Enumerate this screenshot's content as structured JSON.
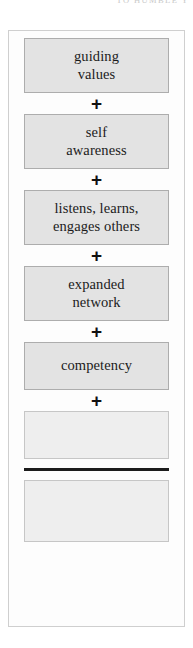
{
  "page": {
    "running_head": "TO HUMBLE Y"
  },
  "figure": {
    "name": "leadership-equation-diagram",
    "operator_symbol": "+",
    "colors": {
      "term_fill": "#e3e3e3",
      "term_border": "#adadad",
      "blank_fill": "#eeeeee",
      "blank_border": "#c6c6c6",
      "frame_border": "#cfcfcf",
      "rule": "#1c1c1c",
      "text": "#1b1b1b"
    },
    "terms": [
      {
        "label": "guiding\nvalues",
        "line1": "guiding",
        "line2": "values",
        "blank": false
      },
      {
        "label": "self\nawareness",
        "line1": "self",
        "line2": "awareness",
        "blank": false
      },
      {
        "label": "listens, learns,\nengages others",
        "line1": "listens, learns,",
        "line2": "engages others",
        "blank": false
      },
      {
        "label": "expanded\nnetwork",
        "line1": "expanded",
        "line2": "network",
        "blank": false
      },
      {
        "label": "competency",
        "line1": "competency",
        "line2": "",
        "blank": false
      },
      {
        "label": "",
        "line1": "",
        "line2": "",
        "blank": true
      }
    ],
    "result": {
      "label": "",
      "blank": true
    }
  }
}
